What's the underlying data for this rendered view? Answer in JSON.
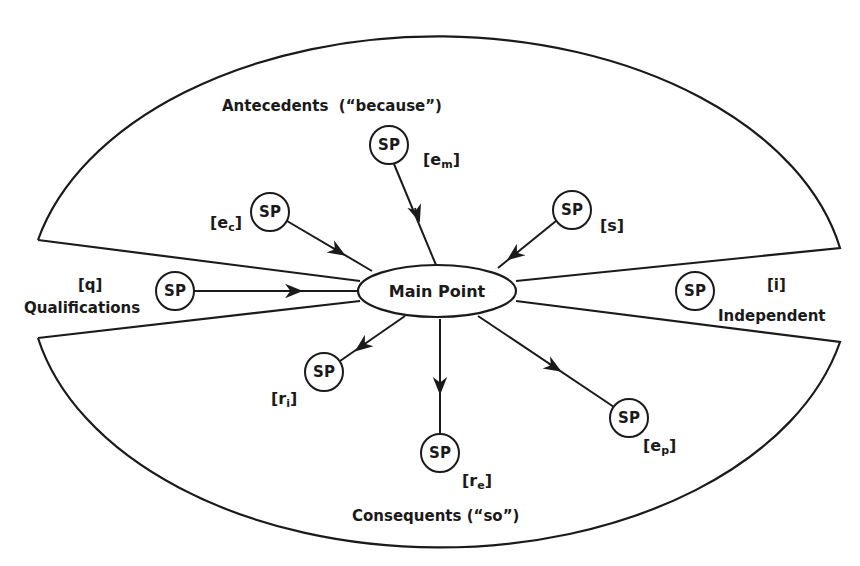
{
  "diagram": {
    "main_point": {
      "label": "Main Point"
    },
    "regions": {
      "antecedents": {
        "label": "Antecedents",
        "connector": "(“because”)"
      },
      "consequents": {
        "label": "Consequents",
        "connector": "(“so”)"
      },
      "qualifications": {
        "label": "Qualifications",
        "tag": "[q]"
      },
      "independent": {
        "label": "Independent",
        "tag": "[i]"
      }
    },
    "nodes": [
      {
        "id": "em",
        "label": "SP",
        "tag_base": "e",
        "tag_sub": "m",
        "region": "antecedents",
        "arrow": "to-main"
      },
      {
        "id": "ec",
        "label": "SP",
        "tag_base": "e",
        "tag_sub": "c",
        "region": "antecedents",
        "arrow": "to-main"
      },
      {
        "id": "s",
        "label": "SP",
        "tag_base": "s",
        "tag_sub": "",
        "region": "antecedents",
        "arrow": "to-main"
      },
      {
        "id": "q",
        "label": "SP",
        "tag_base": "q",
        "tag_sub": "",
        "region": "qualifications",
        "arrow": "to-main"
      },
      {
        "id": "i",
        "label": "SP",
        "tag_base": "i",
        "tag_sub": "",
        "region": "independent",
        "arrow": "none"
      },
      {
        "id": "ri",
        "label": "SP",
        "tag_base": "r",
        "tag_sub": "i",
        "region": "consequents",
        "arrow": "from-main"
      },
      {
        "id": "re",
        "label": "SP",
        "tag_base": "r",
        "tag_sub": "e",
        "region": "consequents",
        "arrow": "from-main"
      },
      {
        "id": "ep",
        "label": "SP",
        "tag_base": "e",
        "tag_sub": "p",
        "region": "consequents",
        "arrow": "from-main"
      }
    ],
    "colors": {
      "stroke": "#1a1a1a",
      "background": "#ffffff"
    }
  }
}
